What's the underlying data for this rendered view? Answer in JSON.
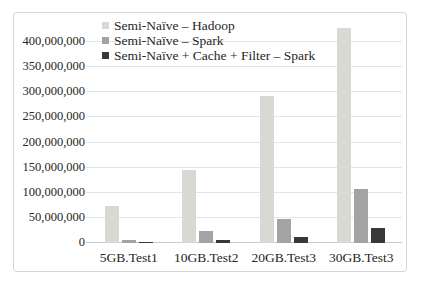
{
  "chart_data": {
    "type": "bar",
    "title": "",
    "xlabel": "",
    "ylabel": "",
    "categories": [
      "5GB.Test1",
      "10GB.Test2",
      "20GB.Test3",
      "30GB.Test3"
    ],
    "series": [
      {
        "name": "Semi-Naïve – Hadoop",
        "color": "#d9d9d3",
        "values": [
          73000000,
          146000000,
          293000000,
          428000000
        ]
      },
      {
        "name": "Semi-Naïve – Spark",
        "color": "#a3a3a3",
        "values": [
          7000000,
          24000000,
          47000000,
          107000000
        ]
      },
      {
        "name": "Semi-Naïve + Cache + Filter – Spark",
        "color": "#383838",
        "values": [
          2000000,
          6000000,
          12000000,
          29000000
        ]
      }
    ],
    "ylim": [
      0,
      450000000
    ],
    "ytick_step": 50000000,
    "ytick_labels": [
      "0",
      "50,000,000",
      "100,000,000",
      "150,000,000",
      "200,000,000",
      "250,000,000",
      "300,000,000",
      "350,000,000",
      "400,000,000"
    ],
    "grid": true,
    "legend_position": "top-inside-vertical"
  },
  "colors": {
    "background": "#ffffff",
    "frame_border": "#d6d6d6",
    "gridline": "#e4e4e2",
    "axis_line": "#c9c9c9",
    "text": "#262626"
  }
}
